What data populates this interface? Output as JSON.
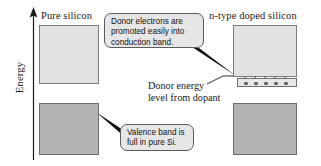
{
  "figure": {
    "axis": {
      "label": "Energy",
      "arrow_direction": "up"
    },
    "columns": [
      {
        "id": "pure",
        "header": "Pure silicon"
      },
      {
        "id": "n-type",
        "header": "n-type doped silicon"
      }
    ],
    "bands": [
      {
        "id": "conduction-pure",
        "column": "pure",
        "type": "conduction",
        "fill": "#e2e2e2",
        "stroke": "#7b7b7b"
      },
      {
        "id": "valence-pure",
        "column": "pure",
        "type": "valence",
        "fill": "#b3b3b3",
        "stroke": "#6e6e6e"
      },
      {
        "id": "conduction-ntype",
        "column": "n-type",
        "type": "conduction",
        "fill": "#e2e2e2",
        "stroke": "#7b7b7b"
      },
      {
        "id": "valence-ntype",
        "column": "n-type",
        "type": "valence",
        "fill": "#b3b3b3",
        "stroke": "#6e6e6e"
      }
    ],
    "donor_level": {
      "fill": "#e8e8e8",
      "stroke": "#6e6e6e",
      "electron_count": 5,
      "promotion_arrow_count": 5,
      "arrow_direction": "up"
    },
    "callouts": [
      {
        "id": "donor-electrons",
        "lines": [
          "Donor electrons are",
          "promoted easily into",
          "conduction band."
        ],
        "fill": "#e6e6e6",
        "stroke": "#5c5c5c",
        "tail_target": "conduction-ntype"
      },
      {
        "id": "valence-full",
        "lines": [
          "Valence band is",
          "full in pure Si."
        ],
        "fill": "#e6e6e6",
        "stroke": "#5c5c5c",
        "tail_target": "valence-pure"
      }
    ],
    "annotations": [
      {
        "id": "donor-energy-level",
        "lines": [
          "Donor energy",
          "level from dopant"
        ],
        "leader_target": "donor-level-strip"
      }
    ]
  }
}
